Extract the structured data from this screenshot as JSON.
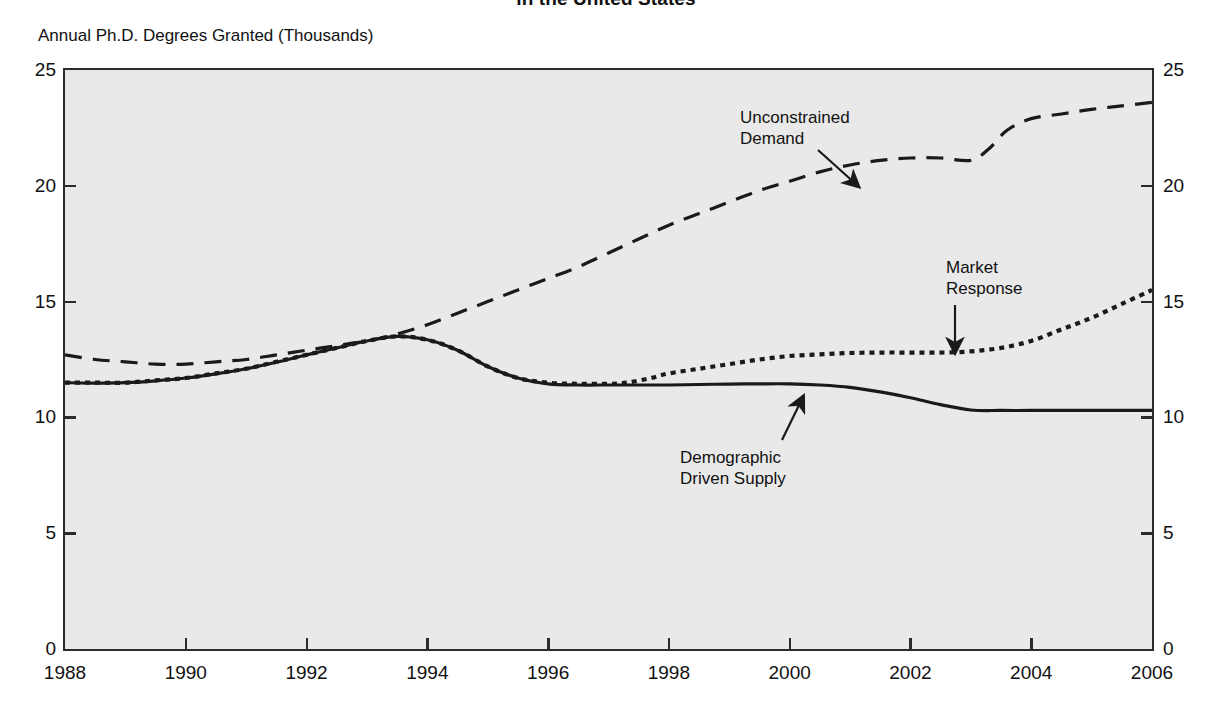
{
  "figure": {
    "title": "in the United States",
    "y_caption": "Annual Ph.D. Degrees Granted (Thousands)"
  },
  "axes": {
    "y_ticks": [
      "0",
      "5",
      "10",
      "15",
      "20",
      "25"
    ],
    "x_ticks": [
      "1988",
      "1990",
      "1992",
      "1994",
      "1996",
      "1998",
      "2000",
      "2002",
      "2004",
      "2006"
    ]
  },
  "annotations": {
    "unconstrained": {
      "line1": "Unconstrained",
      "line2": "Demand"
    },
    "market": {
      "line1": "Market",
      "line2": "Response"
    },
    "demographic": {
      "line1": "Demographic",
      "line2": "Driven Supply"
    }
  },
  "colors": {
    "ink": "#1a1a1a",
    "frame": "#2b2b2b",
    "plot_background": "#e9e9e9",
    "page_background": "#ffffff"
  },
  "chart_data": {
    "type": "line",
    "title": "in the United States",
    "xlabel": "",
    "ylabel": "Annual Ph.D. Degrees Granted (Thousands)",
    "xlim": [
      1988,
      2006
    ],
    "ylim": [
      0,
      25
    ],
    "yticks": [
      0,
      5,
      10,
      15,
      20,
      25
    ],
    "xticks": [
      1988,
      1990,
      1992,
      1994,
      1996,
      1998,
      2000,
      2002,
      2004,
      2006
    ],
    "grid": false,
    "legend": "none (curves labelled inline with arrows)",
    "series": [
      {
        "name": "Unconstrained Demand",
        "style": "dashed",
        "x": [
          1988,
          1988.5,
          1989,
          1989.5,
          1990,
          1990.5,
          1991,
          1991.5,
          1992,
          1992.5,
          1993,
          1993.5,
          1994,
          1994.5,
          1995,
          1995.5,
          1996,
          1996.5,
          1997,
          1997.5,
          1998,
          1998.5,
          1999,
          1999.5,
          2000,
          2000.5,
          2001,
          2001.5,
          2002,
          2002.5,
          2003,
          2003.3,
          2003.6,
          2004,
          2004.5,
          2005,
          2005.5,
          2006
        ],
        "y": [
          12.7,
          12.5,
          12.4,
          12.3,
          12.3,
          12.4,
          12.5,
          12.7,
          12.9,
          13.1,
          13.3,
          13.6,
          14.0,
          14.5,
          15.0,
          15.5,
          16.0,
          16.5,
          17.1,
          17.7,
          18.3,
          18.8,
          19.3,
          19.8,
          20.2,
          20.6,
          20.9,
          21.1,
          21.2,
          21.2,
          21.1,
          21.6,
          22.4,
          22.9,
          23.1,
          23.3,
          23.45,
          23.6
        ]
      },
      {
        "name": "Market Response",
        "style": "dotted",
        "x": [
          1988,
          1988.5,
          1989,
          1989.5,
          1990,
          1990.5,
          1991,
          1991.5,
          1992,
          1992.5,
          1993,
          1993.5,
          1994,
          1994.5,
          1995,
          1995.5,
          1996,
          1996.5,
          1997,
          1997.3,
          1997.7,
          1998,
          1998.5,
          1999,
          1999.5,
          2000,
          2000.5,
          2001,
          2001.5,
          2002,
          2002.5,
          2003,
          2003.5,
          2004,
          2004.5,
          2005,
          2005.5,
          2006
        ],
        "y": [
          11.5,
          11.5,
          11.5,
          11.6,
          11.7,
          11.9,
          12.1,
          12.4,
          12.7,
          13.0,
          13.3,
          13.5,
          13.35,
          12.9,
          12.2,
          11.7,
          11.5,
          11.45,
          11.45,
          11.5,
          11.7,
          11.9,
          12.1,
          12.3,
          12.5,
          12.65,
          12.72,
          12.78,
          12.8,
          12.8,
          12.8,
          12.85,
          13.0,
          13.3,
          13.8,
          14.3,
          14.9,
          15.5
        ]
      },
      {
        "name": "Demographic Driven Supply",
        "style": "solid",
        "x": [
          1988,
          1988.5,
          1989,
          1989.5,
          1990,
          1990.5,
          1991,
          1991.5,
          1992,
          1992.5,
          1993,
          1993.5,
          1994,
          1994.5,
          1995,
          1995.5,
          1996,
          1996.5,
          1997,
          1997.5,
          1998,
          1998.5,
          1999,
          1999.5,
          2000,
          2000.5,
          2001,
          2001.5,
          2002,
          2002.5,
          2003,
          2003.5,
          2004,
          2004.5,
          2005,
          2005.5,
          2006
        ],
        "y": [
          11.5,
          11.48,
          11.5,
          11.58,
          11.7,
          11.88,
          12.1,
          12.38,
          12.7,
          13.0,
          13.3,
          13.5,
          13.35,
          12.9,
          12.2,
          11.7,
          11.45,
          11.4,
          11.4,
          11.4,
          11.4,
          11.42,
          11.44,
          11.45,
          11.45,
          11.4,
          11.3,
          11.1,
          10.85,
          10.55,
          10.32,
          10.3,
          10.3,
          10.3,
          10.3,
          10.3,
          10.3
        ]
      }
    ],
    "callouts": [
      {
        "label": "Unconstrained Demand",
        "points_to_series": "Unconstrained Demand",
        "target_x": 2001,
        "target_y": 20.6
      },
      {
        "label": "Market Response",
        "points_to_series": "Market Response",
        "target_x": 2003,
        "target_y": 12.85
      },
      {
        "label": "Demographic Driven Supply",
        "points_to_series": "Demographic Driven Supply",
        "target_x": 2000.4,
        "target_y": 11.42
      }
    ]
  }
}
